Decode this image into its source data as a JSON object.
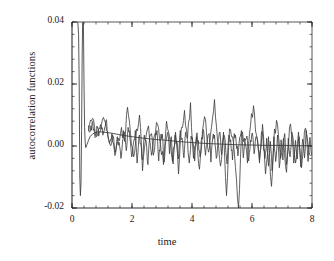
{
  "chart_data": {
    "type": "line",
    "title": "",
    "xlabel": "time",
    "ylabel": "autocorrelation functions",
    "xlim": [
      0,
      8
    ],
    "ylim": [
      -0.02,
      0.04
    ],
    "grid": false,
    "legend": "none",
    "x_ticks": [
      {
        "value": 0,
        "label": "0"
      },
      {
        "value": 2,
        "label": "2"
      },
      {
        "value": 4,
        "label": "4"
      },
      {
        "value": 6,
        "label": "6"
      },
      {
        "value": 8,
        "label": "8"
      }
    ],
    "y_ticks": [
      {
        "value": 0.04,
        "label": "0.04"
      },
      {
        "value": 0.02,
        "label": "0.02"
      },
      {
        "value": 0.0,
        "label": "0.00"
      },
      {
        "value": -0.02,
        "label": "-0.02"
      }
    ],
    "x_minor_step": 0.4,
    "y_minor_step": 0.004,
    "line_color": "#3a3a3a",
    "axis_color": "#2b2b2b",
    "series": [
      {
        "name": "decay-spike",
        "comment": "sharply decaying initial autocorrelation, clipped at top of axis",
        "x": [
          0.0,
          0.05,
          0.1,
          0.14,
          0.18,
          0.2,
          0.22,
          0.24,
          0.26,
          0.28,
          0.3,
          0.32,
          0.34,
          0.36,
          0.38,
          0.4,
          0.42,
          0.44,
          0.46,
          0.5,
          0.55,
          0.6,
          0.7,
          0.8,
          0.9,
          1.0,
          1.2,
          1.4,
          1.6,
          1.8,
          2.0,
          2.4,
          2.8,
          3.2,
          3.6,
          4.0,
          4.5,
          5.0,
          5.5,
          6.0,
          6.5,
          7.0,
          7.5,
          8.0
        ],
        "y": [
          0.06,
          0.058,
          0.052,
          0.046,
          0.041,
          0.039,
          0.036,
          0.02,
          -0.01,
          -0.016,
          -0.012,
          0.005,
          0.03,
          0.044,
          0.04,
          0.02,
          0.006,
          0.001,
          -0.0005,
          0.0005,
          0.0018,
          0.003,
          0.004,
          0.0044,
          0.0046,
          0.0045,
          0.0043,
          0.004,
          0.0036,
          0.0033,
          0.003,
          0.0025,
          0.0021,
          0.0018,
          0.0014,
          0.0011,
          0.0008,
          0.0006,
          0.0004,
          0.0003,
          0.0002,
          0.0002,
          0.0001,
          0.0001
        ]
      },
      {
        "name": "acf-noisy-a",
        "comment": "noisy autocorrelation trace, amplitude ~0.006 decaying slowly",
        "x": [
          0.55,
          0.65,
          0.75,
          0.85,
          0.95,
          1.05,
          1.15,
          1.25,
          1.35,
          1.45,
          1.55,
          1.65,
          1.75,
          1.85,
          1.95,
          2.05,
          2.15,
          2.25,
          2.35,
          2.45,
          2.55,
          2.65,
          2.75,
          2.85,
          2.95,
          3.05,
          3.15,
          3.25,
          3.35,
          3.45,
          3.55,
          3.65,
          3.75,
          3.85,
          3.95,
          4.05,
          4.15,
          4.25,
          4.35,
          4.45,
          4.55,
          4.65,
          4.75,
          4.85,
          4.95,
          5.05,
          5.15,
          5.25,
          5.35,
          5.45,
          5.55,
          5.65,
          5.75,
          5.85,
          5.95,
          6.05,
          6.15,
          6.25,
          6.35,
          6.45,
          6.55,
          6.65,
          6.75,
          6.85,
          6.95,
          7.05,
          7.15,
          7.25,
          7.35,
          7.45,
          7.55,
          7.65,
          7.75,
          7.85,
          7.95
        ],
        "y": [
          0.005,
          0.008,
          0.0062,
          0.0035,
          0.0068,
          0.0092,
          0.005,
          0.001,
          0.0035,
          -0.002,
          0.0025,
          0.006,
          0.0015,
          0.0125,
          0.004,
          -0.0035,
          0.0055,
          0.01,
          -0.008,
          0.002,
          0.0065,
          -0.003,
          0.0035,
          0.007,
          0.0005,
          -0.006,
          0.008,
          0.003,
          -0.005,
          0.0045,
          -0.009,
          0.006,
          0.0115,
          0.0025,
          0.014,
          -0.004,
          0.003,
          -0.0075,
          0.005,
          0.0085,
          -0.002,
          0.006,
          0.015,
          0.002,
          -0.0065,
          0.0045,
          -0.016,
          0.0055,
          0.003,
          -0.007,
          -0.02,
          0.004,
          0.0025,
          -0.0055,
          0.0065,
          0.013,
          0.0035,
          -0.0045,
          0.007,
          -0.009,
          0.003,
          -0.013,
          0.0055,
          0.007,
          -0.004,
          0.0025,
          -0.0085,
          0.006,
          0.0035,
          -0.0055,
          0.0045,
          -0.007,
          0.005,
          0.002,
          -0.003
        ]
      },
      {
        "name": "acf-noisy-b",
        "comment": "second noisy autocorrelation trace, denser higher-frequency fluctuations",
        "x": [
          0.55,
          0.61,
          0.67,
          0.73,
          0.79,
          0.85,
          0.91,
          0.97,
          1.03,
          1.09,
          1.15,
          1.21,
          1.27,
          1.33,
          1.39,
          1.45,
          1.51,
          1.57,
          1.63,
          1.69,
          1.75,
          1.81,
          1.87,
          1.93,
          1.99,
          2.05,
          2.11,
          2.17,
          2.23,
          2.29,
          2.35,
          2.41,
          2.47,
          2.53,
          2.59,
          2.65,
          2.71,
          2.77,
          2.83,
          2.89,
          2.95,
          3.01,
          3.07,
          3.13,
          3.19,
          3.25,
          3.31,
          3.37,
          3.43,
          3.49,
          3.55,
          3.61,
          3.67,
          3.73,
          3.79,
          3.85,
          3.91,
          3.97,
          4.03,
          4.09,
          4.15,
          4.21,
          4.27,
          4.33,
          4.39,
          4.45,
          4.51,
          4.57,
          4.63,
          4.69,
          4.75,
          4.81,
          4.87,
          4.93,
          4.99,
          5.05,
          5.11,
          5.17,
          5.23,
          5.29,
          5.35,
          5.41,
          5.47,
          5.53,
          5.59,
          5.65,
          5.71,
          5.77,
          5.83,
          5.89,
          5.95,
          6.01,
          6.07,
          6.13,
          6.19,
          6.25,
          6.31,
          6.37,
          6.43,
          6.49,
          6.55,
          6.61,
          6.67,
          6.73,
          6.79,
          6.85,
          6.91,
          6.97,
          7.03,
          7.09,
          7.15,
          7.21,
          7.27,
          7.33,
          7.39,
          7.45,
          7.51,
          7.57,
          7.63,
          7.69,
          7.75,
          7.81,
          7.87,
          7.93,
          7.99
        ],
        "y": [
          0.0065,
          0.0048,
          0.0075,
          0.0055,
          0.003,
          0.0058,
          0.0042,
          0.007,
          0.0035,
          0.006,
          0.0085,
          0.0025,
          0.0015,
          0.004,
          0.0005,
          -0.0025,
          0.003,
          0.0012,
          -0.004,
          0.002,
          0.0045,
          -0.0015,
          0.006,
          0.0025,
          -0.0035,
          0.001,
          0.005,
          -0.0055,
          0.003,
          0.0008,
          -0.0045,
          0.0035,
          0.0018,
          -0.006,
          0.0028,
          0.004,
          -0.003,
          0.0015,
          0.005,
          -0.0048,
          0.0022,
          0.0038,
          -0.0052,
          0.0018,
          0.0044,
          -0.0025,
          0.003,
          -0.0058,
          0.0035,
          0.0015,
          -0.0042,
          0.005,
          0.0025,
          -0.0038,
          0.0045,
          0.002,
          -0.0055,
          0.0032,
          0.001,
          -0.0048,
          0.0038,
          0.0018,
          -0.0035,
          0.0028,
          0.0048,
          -0.003,
          0.0015,
          0.004,
          -0.0052,
          0.0025,
          0.0035,
          -0.004,
          0.0018,
          0.0045,
          -0.0028,
          0.003,
          0.0012,
          -0.0058,
          0.0035,
          0.002,
          -0.0045,
          0.004,
          0.0015,
          -0.0032,
          0.0028,
          0.005,
          -0.0038,
          0.0022,
          0.0032,
          -0.0048,
          0.0018,
          0.0042,
          -0.0025,
          0.003,
          0.001,
          -0.0055,
          0.0038,
          0.002,
          -0.004,
          0.0025,
          -0.0065,
          0.0015,
          -0.008,
          0.003,
          -0.005,
          0.0035,
          -0.007,
          0.002,
          -0.0045,
          0.004,
          -0.006,
          0.0025,
          -0.0035,
          0.0045,
          -0.0055,
          0.0018,
          -0.0042,
          0.003,
          -0.0068,
          0.0022,
          -0.0038,
          0.005,
          -0.005,
          0.0028,
          -0.003
        ]
      }
    ]
  }
}
